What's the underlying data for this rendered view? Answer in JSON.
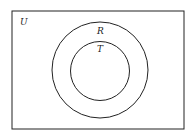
{
  "diagram": {
    "type": "venn",
    "universe": {
      "label": "U"
    },
    "sets": [
      {
        "label": "R",
        "role": "outer circle"
      },
      {
        "label": "T",
        "role": "inner circle, subset of R"
      }
    ],
    "relationship": "T ⊂ R ⊂ U"
  }
}
